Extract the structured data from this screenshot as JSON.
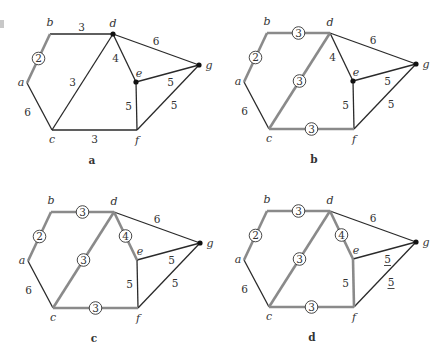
{
  "figure": {
    "vertex_names": [
      "a",
      "b",
      "c",
      "d",
      "e",
      "f",
      "g"
    ],
    "base_coords": {
      "a": [
        27,
        83
      ],
      "b": [
        50,
        34
      ],
      "c": [
        52,
        130
      ],
      "d": [
        113,
        34
      ],
      "e": [
        136,
        82
      ],
      "f": [
        137,
        130
      ],
      "g": [
        199,
        65
      ]
    },
    "edges": [
      {
        "id": "ab",
        "u": "a",
        "v": "b",
        "w": "2"
      },
      {
        "id": "bd",
        "u": "b",
        "v": "d",
        "w": "3"
      },
      {
        "id": "ac",
        "u": "a",
        "v": "c",
        "w": "6"
      },
      {
        "id": "cd",
        "u": "c",
        "v": "d",
        "w": "3"
      },
      {
        "id": "de",
        "u": "d",
        "v": "e",
        "w": "4"
      },
      {
        "id": "dg",
        "u": "d",
        "v": "g",
        "w": "6"
      },
      {
        "id": "eg",
        "u": "e",
        "v": "g",
        "w": "5"
      },
      {
        "id": "ef",
        "u": "e",
        "v": "f",
        "w": "5"
      },
      {
        "id": "fg",
        "u": "f",
        "v": "g",
        "w": "5"
      },
      {
        "id": "cf",
        "u": "c",
        "v": "f",
        "w": "3"
      }
    ],
    "label_offsets": {
      "ab": [
        -14,
        0
      ],
      "bd": [
        0,
        -7
      ],
      "ac": [
        -12,
        6
      ],
      "cd": [
        -10,
        0
      ],
      "de": [
        -9,
        0
      ],
      "dg": [
        0,
        -8
      ],
      "eg": [
        3,
        9
      ],
      "ef": [
        -8,
        0
      ],
      "fg": [
        6,
        8
      ],
      "cf": [
        0,
        9
      ]
    },
    "vertex_label_offsets": {
      "a": [
        -6,
        3
      ],
      "b": [
        0,
        -8
      ],
      "c": [
        0,
        13
      ],
      "d": [
        0,
        -7
      ],
      "e": [
        3,
        -5
      ],
      "f": [
        0,
        14
      ],
      "g": [
        10,
        4
      ]
    },
    "panels": [
      {
        "id": "a",
        "caption": "a",
        "dx": 0,
        "dy": 0,
        "caption_pos": [
          92,
          164
        ],
        "selected": [
          "ab"
        ],
        "circled": [
          "ab"
        ],
        "underlined": [],
        "dots": [
          "d",
          "e",
          "g"
        ]
      },
      {
        "id": "b",
        "caption": "b",
        "dx": 217,
        "dy": -1,
        "caption_pos": [
          314,
          163
        ],
        "selected": [
          "ab",
          "bd",
          "cd",
          "cf"
        ],
        "circled": [
          "ab",
          "bd",
          "cd",
          "cf"
        ],
        "underlined": [],
        "dots": [
          "e",
          "g"
        ]
      },
      {
        "id": "c",
        "caption": "c",
        "dx": 1,
        "dy": 178,
        "caption_pos": [
          94,
          342
        ],
        "selected": [
          "ab",
          "bd",
          "cd",
          "cf",
          "de"
        ],
        "circled": [
          "ab",
          "bd",
          "cd",
          "cf",
          "de"
        ],
        "underlined": [],
        "dots": [
          "g"
        ]
      },
      {
        "id": "d",
        "caption": "d",
        "dx": 217,
        "dy": 177,
        "caption_pos": [
          312,
          341
        ],
        "selected": [
          "ab",
          "bd",
          "cd",
          "cf",
          "de",
          "ef"
        ],
        "circled": [
          "ab",
          "bd",
          "cd",
          "cf",
          "de"
        ],
        "underlined": [
          "eg",
          "fg"
        ],
        "dots": [
          "g"
        ]
      }
    ]
  }
}
